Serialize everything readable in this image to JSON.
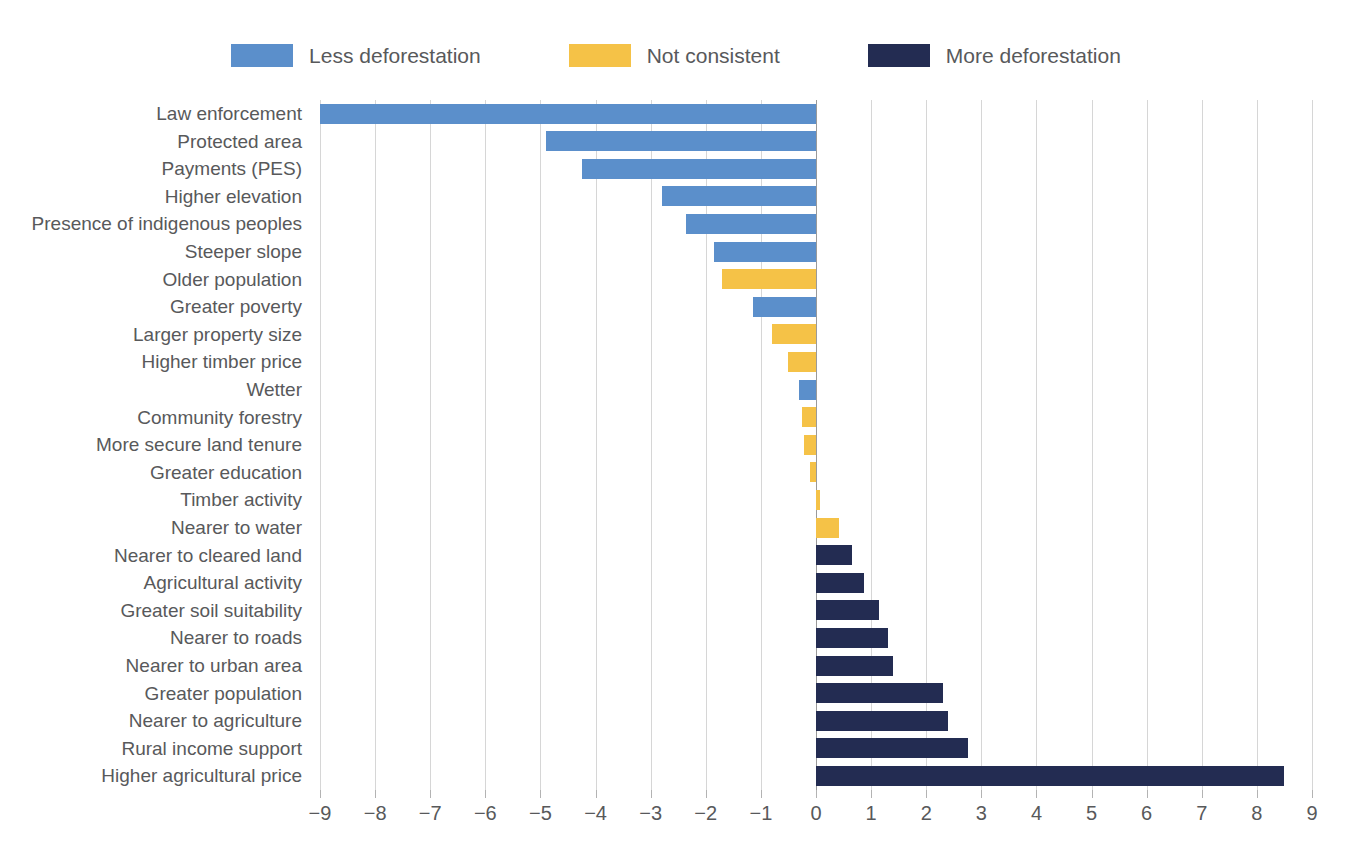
{
  "chart_data": {
    "type": "bar",
    "orientation": "horizontal",
    "title": "",
    "subtitle": "",
    "xlabel": "",
    "ylabel": "",
    "xlim": [
      -9,
      9
    ],
    "xticks": [
      -9,
      -8,
      -7,
      -6,
      -5,
      -4,
      -3,
      -2,
      -1,
      0,
      1,
      2,
      3,
      4,
      5,
      6,
      7,
      8,
      9
    ],
    "xtick_labels": [
      "−9",
      "−8",
      "−7",
      "−6",
      "−5",
      "−4",
      "−3",
      "−2",
      "−1",
      "0",
      "1",
      "2",
      "3",
      "4",
      "5",
      "6",
      "7",
      "8",
      "9"
    ],
    "grid": "vertical",
    "legend_position": "top-center",
    "legend": [
      {
        "label": "Less deforestation",
        "color": "#5b8fcb",
        "key": "less"
      },
      {
        "label": "Not consistent",
        "color": "#f5c247",
        "key": "notconsistent"
      },
      {
        "label": "More deforestation",
        "color": "#232c52",
        "key": "more"
      }
    ],
    "categories": [
      "Law enforcement",
      "Protected area",
      "Payments (PES)",
      "Higher elevation",
      "Presence of indigenous peoples",
      "Steeper slope",
      "Older population",
      "Greater poverty",
      "Larger property size",
      "Higher timber price",
      "Wetter",
      "Community forestry",
      "More secure land tenure",
      "Greater education",
      "Timber activity",
      "Nearer to water",
      "Nearer to cleared land",
      "Agricultural activity",
      "Greater soil suitability",
      "Nearer to roads",
      "Nearer to urban area",
      "Greater population",
      "Nearer to agriculture",
      "Rural income support",
      "Higher agricultural price"
    ],
    "values": [
      -9.0,
      -4.9,
      -4.25,
      -2.8,
      -2.35,
      -1.85,
      -1.7,
      -1.15,
      -0.8,
      -0.5,
      -0.3,
      -0.25,
      -0.22,
      -0.1,
      0.08,
      0.42,
      0.65,
      0.88,
      1.15,
      1.3,
      1.4,
      2.3,
      2.4,
      2.75,
      8.5
    ],
    "series_keys": [
      "less",
      "less",
      "less",
      "less",
      "less",
      "less",
      "notconsistent",
      "less",
      "notconsistent",
      "notconsistent",
      "less",
      "notconsistent",
      "notconsistent",
      "notconsistent",
      "notconsistent",
      "notconsistent",
      "more",
      "more",
      "more",
      "more",
      "more",
      "more",
      "more",
      "more",
      "more"
    ]
  }
}
